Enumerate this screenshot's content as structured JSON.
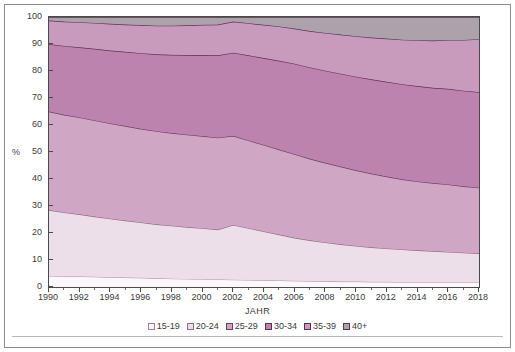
{
  "chart_data": {
    "type": "area",
    "stacked": true,
    "title": "",
    "xlabel": "JAHR",
    "ylabel": "%",
    "ylim": [
      0,
      100
    ],
    "xlim": [
      1990,
      2018
    ],
    "ytick_step": 10,
    "xtick_step": 2,
    "grid": false,
    "legend_position": "bottom",
    "x": [
      1990,
      1991,
      1992,
      1993,
      1994,
      1995,
      1996,
      1997,
      1998,
      1999,
      2000,
      2001,
      2002,
      2003,
      2004,
      2005,
      2006,
      2007,
      2008,
      2009,
      2010,
      2011,
      2012,
      2013,
      2014,
      2015,
      2016,
      2017,
      2018
    ],
    "yticks": [
      0,
      10,
      20,
      30,
      40,
      50,
      60,
      70,
      80,
      90,
      100
    ],
    "ytick_labels": [
      "0",
      "10",
      "20",
      "30",
      "40",
      "50",
      "60",
      "70",
      "80",
      "90",
      "100"
    ],
    "xticks": [
      1990,
      1992,
      1994,
      1996,
      1998,
      2000,
      2002,
      2004,
      2006,
      2008,
      2010,
      2012,
      2014,
      2016,
      2018
    ],
    "xtick_labels": [
      "1990",
      "1992",
      "1994",
      "1996",
      "1998",
      "2000",
      "2002",
      "2004",
      "2006",
      "2008",
      "2010",
      "2012",
      "2014",
      "2016",
      "2018"
    ],
    "series": [
      {
        "name": "15-19",
        "color": "#fbf7fa",
        "line_color": "#9d7f96",
        "values": [
          4.1,
          4.0,
          3.9,
          3.8,
          3.6,
          3.5,
          3.4,
          3.2,
          3.1,
          3.0,
          2.9,
          2.8,
          2.7,
          2.6,
          2.5,
          2.4,
          2.3,
          2.2,
          2.1,
          2.0,
          2.0,
          1.9,
          1.9,
          1.8,
          1.8,
          1.8,
          1.8,
          1.8,
          1.8
        ]
      },
      {
        "name": "20-24",
        "color": "#eddfe9",
        "line_color": "#8c6d86",
        "values": [
          24.4,
          23.6,
          23.0,
          22.3,
          21.7,
          21.1,
          20.5,
          20.0,
          19.6,
          19.2,
          18.9,
          18.5,
          20.3,
          19.2,
          18.1,
          17.0,
          15.9,
          15.1,
          14.4,
          13.8,
          13.2,
          12.8,
          12.4,
          12.1,
          11.8,
          11.5,
          11.2,
          10.9,
          10.7
        ]
      },
      {
        "name": "25-29",
        "color": "#cfa7c4",
        "line_color": "#6d3f63",
        "values": [
          36.5,
          36.2,
          35.9,
          35.6,
          35.3,
          35.0,
          34.7,
          34.5,
          34.3,
          34.2,
          34.1,
          34.0,
          33.0,
          32.5,
          32.0,
          31.5,
          31.0,
          30.2,
          29.5,
          28.8,
          28.0,
          27.3,
          26.6,
          26.0,
          25.5,
          25.2,
          25.0,
          24.6,
          24.3
        ]
      },
      {
        "name": "30-34",
        "color": "#bb83ad",
        "line_color": "#5e2f55",
        "values": [
          25.0,
          25.5,
          26.0,
          26.5,
          27.0,
          27.5,
          28.0,
          28.5,
          29.0,
          29.5,
          30.0,
          30.5,
          30.8,
          31.5,
          32.2,
          32.9,
          33.5,
          33.8,
          34.1,
          34.4,
          34.7,
          34.9,
          35.1,
          35.2,
          35.3,
          35.3,
          35.4,
          35.4,
          35.4
        ]
      },
      {
        "name": "35-39",
        "color": "#c89bbd",
        "line_color": "#5e2f55",
        "values": [
          8.7,
          9.0,
          9.3,
          9.6,
          9.9,
          10.1,
          10.4,
          10.6,
          10.8,
          11.0,
          11.2,
          11.4,
          11.5,
          11.9,
          12.3,
          12.7,
          13.0,
          13.5,
          14.0,
          14.5,
          15.0,
          15.5,
          16.0,
          16.5,
          17.0,
          17.5,
          18.1,
          18.8,
          19.6
        ]
      },
      {
        "name": "40+",
        "color": "#ada1ab",
        "line_color": "#4f3a4b",
        "values": [
          1.3,
          1.7,
          1.9,
          2.2,
          2.5,
          2.8,
          3.0,
          3.2,
          3.2,
          3.1,
          3.0,
          2.8,
          1.7,
          2.3,
          2.9,
          3.5,
          4.3,
          5.2,
          5.9,
          6.5,
          7.1,
          7.6,
          8.0,
          8.4,
          8.6,
          8.8,
          8.5,
          8.5,
          8.2
        ]
      }
    ]
  },
  "axes": {
    "y_unit_label": "%",
    "x_title": "JAHR"
  }
}
